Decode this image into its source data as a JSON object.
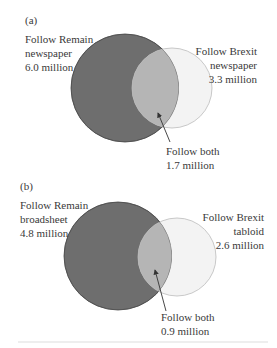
{
  "panels": [
    {
      "tag": "(a)",
      "left_label": [
        "Follow Remain",
        "newspaper",
        "6.0 million"
      ],
      "right_label": [
        "Follow Brexit",
        "newspaper",
        "3.3 million"
      ],
      "overlap_label": [
        "Follow both",
        "1.7 million"
      ]
    },
    {
      "tag": "(b)",
      "left_label": [
        "Follow Remain",
        "broadsheet",
        "4.8 million"
      ],
      "right_label": [
        "Follow Brexit",
        "tabloid",
        "2.6 million"
      ],
      "overlap_label": [
        "Follow both",
        "0.9 million"
      ]
    }
  ],
  "colors": {
    "remain_fill": "#6e6e6e",
    "brexit_fill": "#f2f2f2",
    "overlap_fill": "#b5b5b5",
    "outline": "#555555"
  }
}
